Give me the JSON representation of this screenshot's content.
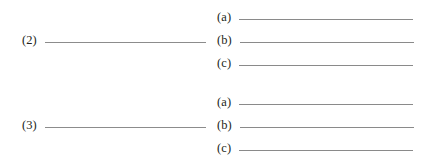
{
  "page": {
    "background_color": "#ffffff",
    "rule_color": "#8a8a8a",
    "text_color": "#231f20"
  },
  "worksheet": {
    "groups": [
      {
        "main": {
          "label": "(2)",
          "blank_width_px": 161
        },
        "subitems": [
          {
            "label": "(a)",
            "blank_width_px": 174
          },
          {
            "label": "(b)",
            "blank_width_px": 174
          },
          {
            "label": "(c)",
            "blank_width_px": 174
          }
        ]
      },
      {
        "main": {
          "label": "(3)",
          "blank_width_px": 161
        },
        "subitems": [
          {
            "label": "(a)",
            "blank_width_px": 174
          },
          {
            "label": "(b)",
            "blank_width_px": 174
          },
          {
            "label": "(c)",
            "blank_width_px": 174
          }
        ]
      }
    ]
  }
}
